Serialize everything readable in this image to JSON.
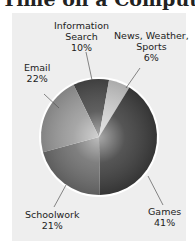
{
  "title": "Time on a Computer",
  "chart_data": {
    "type": "pie",
    "title": "Time on a Computer",
    "categories": [
      "Information Search",
      "News, Weather, Sports",
      "Games",
      "Schoolwork",
      "Email"
    ],
    "values": [
      10,
      6,
      41,
      21,
      22
    ],
    "unit": "%",
    "labels": [
      {
        "name": "Information Search",
        "lines": [
          "Information",
          "Search",
          "10%"
        ]
      },
      {
        "name": "News, Weather, Sports",
        "lines": [
          "News, Weather,",
          "Sports",
          "6%"
        ]
      },
      {
        "name": "Games",
        "lines": [
          "Games",
          "41%"
        ]
      },
      {
        "name": "Schoolwork",
        "lines": [
          "Schoolwork",
          "21%"
        ]
      },
      {
        "name": "Email",
        "lines": [
          "Email",
          "22%"
        ]
      }
    ],
    "slice_colors": [
      "#4a4a4a",
      "#c9c9c9",
      "#3e3e3e",
      "#6e6e6e",
      "#9a9a9a"
    ],
    "legend": "none (direct labels with leader lines)",
    "grid": false
  },
  "colors": {
    "panel_bg": "#eeeeee",
    "page_bg": "#ffffff",
    "text": "#222222",
    "outline": "#ffffff"
  }
}
